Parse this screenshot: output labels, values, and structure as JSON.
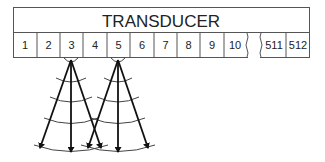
{
  "title": "TRANSDUCER",
  "elements": [
    "1",
    "2",
    "3",
    "4",
    "5",
    "6",
    "7",
    "8",
    "9",
    "10",
    "511",
    "512"
  ],
  "beams": [
    {
      "element": "3",
      "apex_x": 71
    },
    {
      "element": "5",
      "apex_x": 118
    }
  ],
  "colors": {
    "line": "#333333",
    "arrow": "#111111",
    "background": "#ffffff"
  }
}
